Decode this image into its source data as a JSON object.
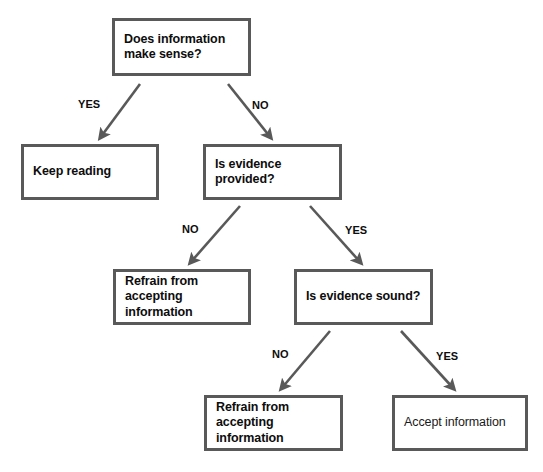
{
  "diagram": {
    "background_color": "#ffffff",
    "box_border_color": "#595959",
    "text_color": "#0d0d0d",
    "arrow_color": "#595959",
    "nodes": [
      {
        "id": "does-information-make-sense",
        "text": "Does information\nmake sense?",
        "weight": "bold",
        "x": 112,
        "y": 18,
        "w": 139,
        "h": 58
      },
      {
        "id": "keep-reading",
        "text": "Keep reading",
        "weight": "bold",
        "x": 21,
        "y": 144,
        "w": 138,
        "h": 56
      },
      {
        "id": "is-evidence-provided",
        "text": "Is evidence provided?",
        "weight": "bold",
        "x": 203,
        "y": 144,
        "w": 139,
        "h": 56
      },
      {
        "id": "refrain-from-accepting-information-1",
        "text": "Refrain from accepting\ninformation",
        "weight": "bold",
        "x": 113,
        "y": 269,
        "w": 138,
        "h": 56
      },
      {
        "id": "is-evidence-sound",
        "text": "Is evidence sound?",
        "weight": "bold",
        "x": 294,
        "y": 269,
        "w": 139,
        "h": 56
      },
      {
        "id": "refrain-from-accepting-information-2",
        "text": "Refrain from accepting\ninformation",
        "weight": "bold",
        "x": 204,
        "y": 395,
        "w": 139,
        "h": 56
      },
      {
        "id": "accept-information",
        "text": "Accept information",
        "weight": "regular",
        "x": 392,
        "y": 395,
        "w": 136,
        "h": 56
      }
    ],
    "edges": [
      {
        "id": "sense-yes-keep-reading",
        "label": "YES",
        "from": "does-information-make-sense",
        "to": "keep-reading",
        "x1": 140,
        "y1": 84,
        "x2": 100,
        "y2": 138,
        "label_x": 78,
        "label_y": 98
      },
      {
        "id": "sense-no-evidence-provided",
        "label": "NO",
        "from": "does-information-make-sense",
        "to": "is-evidence-provided",
        "x1": 228,
        "y1": 84,
        "x2": 271,
        "y2": 138,
        "label_x": 252,
        "label_y": 99
      },
      {
        "id": "provided-no-refrain",
        "label": "NO",
        "from": "is-evidence-provided",
        "to": "refrain-from-accepting-information-1",
        "x1": 240,
        "y1": 206,
        "x2": 190,
        "y2": 263,
        "label_x": 182,
        "label_y": 223
      },
      {
        "id": "provided-yes-evidence-sound",
        "label": "YES",
        "from": "is-evidence-provided",
        "to": "is-evidence-sound",
        "x1": 310,
        "y1": 206,
        "x2": 361,
        "y2": 263,
        "label_x": 345,
        "label_y": 224
      },
      {
        "id": "sound-no-refrain",
        "label": "NO",
        "from": "is-evidence-sound",
        "to": "refrain-from-accepting-information-2",
        "x1": 330,
        "y1": 331,
        "x2": 281,
        "y2": 389,
        "label_x": 272,
        "label_y": 348
      },
      {
        "id": "sound-yes-accept",
        "label": "YES",
        "from": "is-evidence-sound",
        "to": "accept-information",
        "x1": 401,
        "y1": 331,
        "x2": 454,
        "y2": 389,
        "label_x": 436,
        "label_y": 350
      }
    ]
  }
}
